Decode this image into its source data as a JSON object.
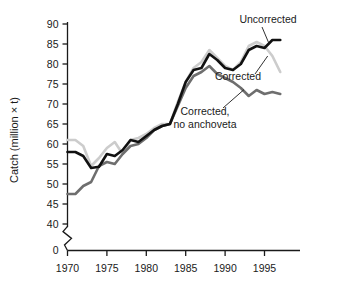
{
  "chart_data": {
    "type": "line",
    "title": "",
    "xlabel": "",
    "ylabel": "Catch (million × t)",
    "xlim": [
      1970,
      1997
    ],
    "ylim": [
      38,
      90
    ],
    "grid": false,
    "legend_position": "inline-annotations",
    "y_axis_break": true,
    "y_ticks": [
      "0",
      "40",
      "45",
      "50",
      "55",
      "60",
      "65",
      "70",
      "75",
      "80",
      "85",
      "90"
    ],
    "y_tick_values": [
      0,
      40,
      45,
      50,
      55,
      60,
      65,
      70,
      75,
      80,
      85,
      90
    ],
    "x_ticks": [
      "1970",
      "1975",
      "1980",
      "1985",
      "1990",
      "1995"
    ],
    "x_tick_values": [
      1970,
      1975,
      1980,
      1985,
      1990,
      1995
    ],
    "x": [
      1970,
      1971,
      1972,
      1973,
      1974,
      1975,
      1976,
      1977,
      1978,
      1979,
      1980,
      1981,
      1982,
      1983,
      1984,
      1985,
      1986,
      1987,
      1988,
      1989,
      1990,
      1991,
      1992,
      1993,
      1994,
      1995,
      1996,
      1997
    ],
    "series": [
      {
        "name": "Uncorrected",
        "color": "#111111",
        "width": 2.6,
        "values": [
          58.0,
          58.0,
          57.0,
          54.0,
          54.3,
          57.5,
          57.0,
          58.5,
          61.0,
          60.5,
          62.0,
          63.5,
          64.5,
          65.0,
          70.0,
          75.5,
          78.5,
          79.0,
          82.5,
          81.0,
          79.0,
          78.5,
          80.0,
          83.5,
          84.5,
          84.0,
          86.0,
          86.0
        ]
      },
      {
        "name": "Corrected",
        "color": "#cccccc",
        "width": 2.6,
        "values": [
          61.0,
          61.0,
          59.5,
          54.5,
          56.5,
          59.0,
          60.5,
          57.5,
          61.0,
          61.5,
          62.5,
          64.0,
          65.0,
          65.0,
          70.5,
          75.5,
          79.0,
          80.5,
          83.5,
          81.5,
          79.5,
          78.5,
          80.5,
          84.5,
          85.5,
          84.5,
          82.0,
          78.0
        ]
      },
      {
        "name": "Corrected, no anchoveta",
        "color": "#6e6e6e",
        "width": 2.6,
        "values": [
          47.5,
          47.5,
          49.5,
          50.5,
          54.5,
          55.5,
          55.0,
          57.5,
          59.5,
          60.0,
          61.5,
          63.5,
          64.5,
          65.0,
          69.5,
          74.0,
          77.0,
          78.0,
          79.5,
          77.5,
          76.5,
          75.5,
          74.0,
          72.0,
          73.5,
          72.5,
          73.0,
          72.5
        ]
      }
    ],
    "annotations": [
      {
        "text": "Uncorrected",
        "target_x": 1995.6,
        "target_y": 85.0
      },
      {
        "text_line1": "Corrected",
        "target_x": 1995.4,
        "target_y": 82.0
      },
      {
        "text_line1": "Corrected,",
        "text_line2": "no anchoveta",
        "target_x": 1992.4,
        "target_y": 73.6
      }
    ]
  }
}
